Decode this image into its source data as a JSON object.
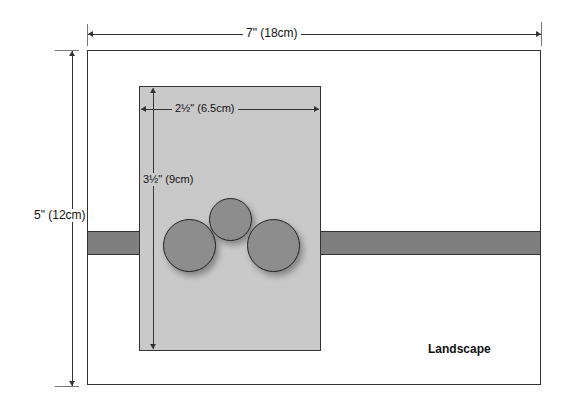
{
  "diagram": {
    "title": "Landscape",
    "outer": {
      "width_label": "7\" (18cm)",
      "height_label": "5\" (12cm)"
    },
    "inner": {
      "width_label": "2½\" (6.5cm)",
      "height_label": "3½\" (9cm)"
    },
    "elements": {
      "band": "horizontal band",
      "circles": 3
    },
    "colors": {
      "page": "#ffffff",
      "card": "#c9c9c9",
      "band": "#7f7f7f",
      "circle": "#8d8d8d",
      "stroke": "#222222"
    }
  }
}
